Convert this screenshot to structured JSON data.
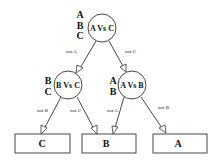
{
  "diagram": {
    "nodes": [
      {
        "id": "root",
        "label": "A Vs C",
        "candidates": [
          "A",
          "B",
          "C"
        ]
      },
      {
        "id": "left",
        "label": "B Vs C",
        "candidates": [
          "B",
          "C"
        ]
      },
      {
        "id": "right",
        "label": "A Vs B",
        "candidates": [
          "A",
          "B"
        ]
      }
    ],
    "leaves": [
      {
        "id": "leaf-c",
        "label": "C"
      },
      {
        "id": "leaf-b",
        "label": "B"
      },
      {
        "id": "leaf-a",
        "label": "A"
      }
    ],
    "edges": [
      {
        "from": "root",
        "to": "left",
        "label": "not A"
      },
      {
        "from": "root",
        "to": "right",
        "label": "not C"
      },
      {
        "from": "left",
        "to": "leaf-c",
        "label": "not B"
      },
      {
        "from": "left",
        "to": "leaf-b",
        "label": "not C"
      },
      {
        "from": "right",
        "to": "leaf-b",
        "label": "not A"
      },
      {
        "from": "right",
        "to": "leaf-a",
        "label": "not B"
      }
    ]
  }
}
